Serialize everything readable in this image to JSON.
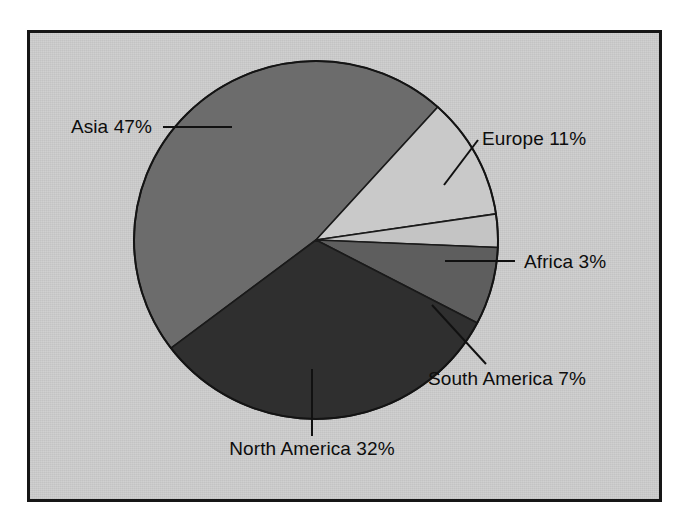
{
  "figure": {
    "background_color": "#ffffff",
    "panel_color": "#cfcfcf",
    "border_color": "#161616"
  },
  "chart_data": {
    "type": "pie",
    "title": "",
    "subtitle": "",
    "xlabel": "",
    "ylabel": "",
    "legend_position": "none",
    "grid": false,
    "labels_show_percent": true,
    "categories": [
      "Asia",
      "Europe",
      "Africa",
      "South America",
      "North America"
    ],
    "values": [
      47,
      11,
      3,
      7,
      32
    ],
    "unit": "%",
    "slices": [
      {
        "name": "Asia",
        "value": 47,
        "label": "Asia 47%",
        "color": "#6c6c6c",
        "start_angle_deg": -48,
        "end_angle_deg": -217.2,
        "label_x": 152,
        "label_y": 133,
        "label_anchor": "end",
        "leader": {
          "x1": 163,
          "y1": 127,
          "x2": 232,
          "y2": 127
        }
      },
      {
        "name": "Europe",
        "value": 11,
        "label": "Europe 11%",
        "color": "#c9c9c9",
        "start_angle_deg": -48,
        "end_angle_deg": -8.4,
        "label_x": 482,
        "label_y": 145,
        "label_anchor": "start",
        "leader": {
          "x1": 444,
          "y1": 185,
          "x2": 478,
          "y2": 140
        }
      },
      {
        "name": "Africa",
        "value": 3,
        "label": "Africa 3%",
        "color": "#c4c4c4",
        "start_angle_deg": -8.4,
        "end_angle_deg": 2.4,
        "label_x": 524,
        "label_y": 268,
        "label_anchor": "start",
        "leader": {
          "x1": 445,
          "y1": 261,
          "x2": 515,
          "y2": 261
        }
      },
      {
        "name": "South America",
        "value": 7,
        "label": "South America 7%",
        "color": "#5e5e5e",
        "start_angle_deg": 2.4,
        "end_angle_deg": 27.6,
        "label_x": 428,
        "label_y": 385,
        "label_anchor": "start",
        "leader": {
          "x1": 432,
          "y1": 305,
          "x2": 486,
          "y2": 364
        }
      },
      {
        "name": "North America",
        "value": 32,
        "label": "North America 32%",
        "color": "#2f2f2f",
        "start_angle_deg": 27.6,
        "end_angle_deg": 142.8,
        "label_x": 312,
        "label_y": 455,
        "label_anchor": "middle",
        "leader": {
          "x1": 312,
          "y1": 369,
          "x2": 312,
          "y2": 436
        }
      }
    ],
    "geometry": {
      "center_x": 316,
      "center_y": 240,
      "radius_x": 182,
      "radius_y": 179
    }
  }
}
